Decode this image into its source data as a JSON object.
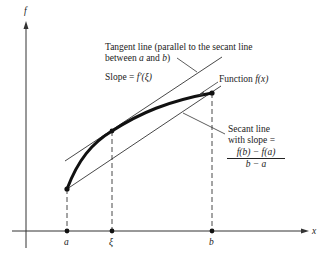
{
  "figure": {
    "axes": {
      "y_label": "f",
      "x_label": "x"
    },
    "x_ticks": [
      {
        "label": "a",
        "x": 67
      },
      {
        "label": "ξ",
        "x": 112
      },
      {
        "label": "b",
        "x": 212
      }
    ],
    "annotations": {
      "tangent_line_1": "Tangent line (parallel to the secant line",
      "tangent_line_2_pre": "between ",
      "tangent_line_2_a": "a",
      "tangent_line_2_mid": " and ",
      "tangent_line_2_b": "b",
      "tangent_line_2_post": ")",
      "slope_label": "Slope = ",
      "slope_expr": "f′(ξ)",
      "function_label": "Function ",
      "function_expr": "f(x)",
      "secant_1": "Secant line",
      "secant_2": "with slope =",
      "secant_numerator": "f(b) − f(a)",
      "secant_denominator": "b − a"
    },
    "colors": {
      "ink": "#222222",
      "background": "#ffffff"
    }
  }
}
